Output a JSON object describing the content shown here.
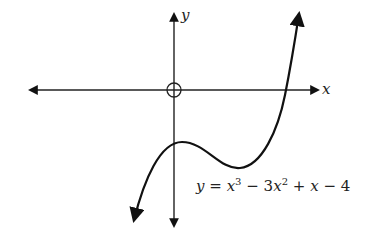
{
  "diagram": {
    "type": "function-graph",
    "axes": {
      "x_label": "x",
      "y_label": "y",
      "origin_marker": "open-circle"
    },
    "equation": {
      "lhs": "y",
      "eq": "=",
      "t1_var": "x",
      "t1_exp": "3",
      "op1": "−",
      "t2_coef": "3",
      "t2_var": "x",
      "t2_exp": "2",
      "op2": "+",
      "t3_var": "x",
      "op3": "−",
      "const": "4"
    },
    "curve": {
      "function": "y = x^3 - 3x^2 + x - 4",
      "features": [
        "local maximum just right of y-axis below x-axis",
        "local minimum below x-axis",
        "single x-intercept on positive x-axis"
      ],
      "color": "#111111"
    }
  }
}
